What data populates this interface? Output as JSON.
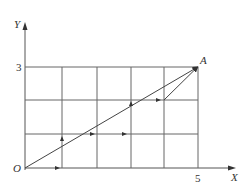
{
  "diagram": {
    "axes": {
      "x_label": "X",
      "y_label": "Y",
      "origin_label": "O",
      "x_tick": "5",
      "y_tick": "3"
    },
    "point_label": "A",
    "grid": {
      "columns": 5,
      "rows": 3
    },
    "path": {
      "description": "Staircase path from O to A with arrows, plus straight line OA",
      "points": [
        [
          0,
          0
        ],
        [
          1,
          0
        ],
        [
          1,
          1
        ],
        [
          3,
          1
        ],
        [
          3,
          2
        ],
        [
          4,
          2
        ],
        [
          5,
          3
        ]
      ]
    },
    "colors": {
      "line": "#555555",
      "text": "#333333"
    }
  }
}
